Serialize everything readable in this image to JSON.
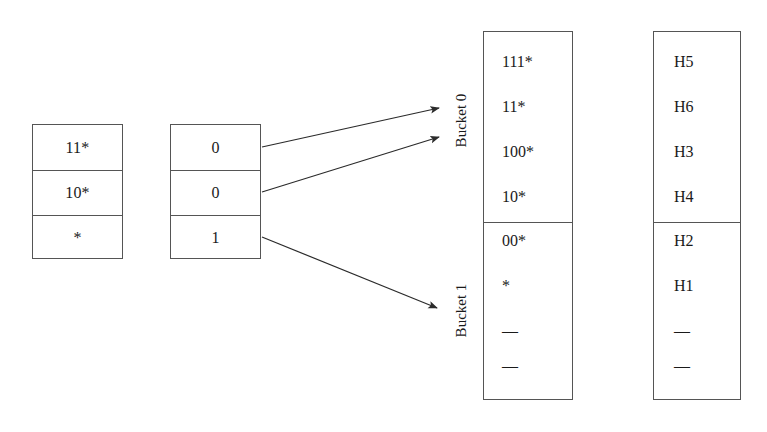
{
  "diagram": {
    "stroke_color": "#555555",
    "text_color": "#1a1a1a",
    "background": "#ffffff"
  },
  "prefix_table": {
    "name": "prefix-table",
    "rows": [
      {
        "label": "11*"
      },
      {
        "label": "10*"
      },
      {
        "label": "*"
      }
    ]
  },
  "directory_table": {
    "name": "directory-table",
    "rows": [
      {
        "label": "0"
      },
      {
        "label": "0"
      },
      {
        "label": "1"
      }
    ]
  },
  "buckets": {
    "labels": [
      {
        "text": "Bucket 0"
      },
      {
        "text": "Bucket 1"
      }
    ],
    "bucket0_entries": [
      {
        "label": "111*"
      },
      {
        "label": "11*"
      },
      {
        "label": "100*"
      },
      {
        "label": "10*"
      }
    ],
    "bucket1_entries": [
      {
        "label": "00*"
      },
      {
        "label": "*"
      },
      {
        "label": "—"
      },
      {
        "label": "—"
      }
    ]
  },
  "hash_column": {
    "name": "hash-column",
    "top_entries": [
      {
        "label": "H5"
      },
      {
        "label": "H6"
      },
      {
        "label": "H3"
      },
      {
        "label": "H4"
      }
    ],
    "bottom_entries": [
      {
        "label": "H2"
      },
      {
        "label": "H1"
      },
      {
        "label": "—"
      },
      {
        "label": "—"
      }
    ]
  },
  "arrows": [
    {
      "name": "arrow-dir0-to-bucket0",
      "from": "directory row 0",
      "to": "Bucket 0"
    },
    {
      "name": "arrow-dir1-to-bucket0",
      "from": "directory row 1",
      "to": "Bucket 0"
    },
    {
      "name": "arrow-dir2-to-bucket1",
      "from": "directory row 2",
      "to": "Bucket 1"
    }
  ]
}
